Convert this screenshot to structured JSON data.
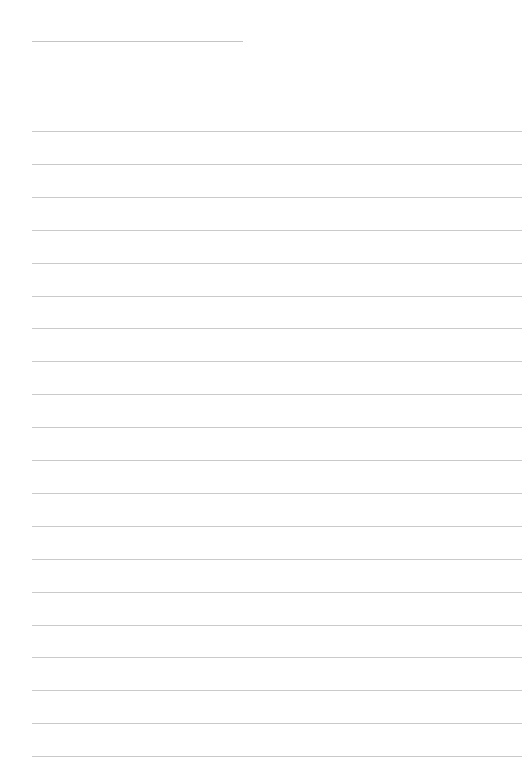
{
  "page": {
    "type": "blank ruled writing sheet",
    "header": {
      "title_field_text": ""
    },
    "lines": [
      {
        "text": ""
      },
      {
        "text": ""
      },
      {
        "text": ""
      },
      {
        "text": ""
      },
      {
        "text": ""
      },
      {
        "text": ""
      },
      {
        "text": ""
      },
      {
        "text": ""
      },
      {
        "text": ""
      },
      {
        "text": ""
      },
      {
        "text": ""
      },
      {
        "text": ""
      },
      {
        "text": ""
      },
      {
        "text": ""
      },
      {
        "text": ""
      },
      {
        "text": ""
      },
      {
        "text": ""
      },
      {
        "text": ""
      },
      {
        "text": ""
      },
      {
        "text": ""
      }
    ],
    "colors": {
      "background": "#ffffff",
      "rule": "#cacaca"
    }
  }
}
